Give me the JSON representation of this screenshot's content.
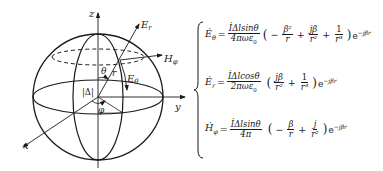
{
  "diagram": {
    "type": "spherical-coordinate dipole radiation field",
    "axes": {
      "z": "z",
      "y": "y",
      "x": "x"
    },
    "labels": {
      "E_r": "E",
      "E_r_sub": "r",
      "H_phi": "H",
      "H_phi_sub": "φ",
      "E_theta": "E",
      "E_theta_sub": "θ",
      "theta": "θ",
      "r": "r",
      "phi": "φ",
      "dipole": "|Δ|"
    }
  },
  "equations": [
    {
      "lhs": "Ė",
      "lhs_sub": "θ",
      "equals": "=",
      "coef_num": "İΔlsinθ",
      "coef_den": "4πωε",
      "coef_den_sub": "0",
      "terms": [
        {
          "sign": "−",
          "num": "β²",
          "den": "r"
        },
        {
          "sign": "+",
          "num": "jβ",
          "den": "r²"
        },
        {
          "sign": "+",
          "num": "1",
          "den": "r³"
        }
      ],
      "exp": "e",
      "exp_power": "−jβr"
    },
    {
      "lhs": "Ė",
      "lhs_sub": "r",
      "equals": "=",
      "coef_num": "İΔlcosθ",
      "coef_den": "2πωε",
      "coef_den_sub": "0",
      "terms": [
        {
          "sign": "",
          "num": "jβ",
          "den": "r²"
        },
        {
          "sign": "+",
          "num": "1",
          "den": "r³"
        }
      ],
      "exp": "e",
      "exp_power": "−jβr"
    },
    {
      "lhs": "Ḣ",
      "lhs_sub": "φ",
      "equals": "=",
      "coef_num": "İΔlsinθ",
      "coef_den": "4π",
      "coef_den_sub": "",
      "terms": [
        {
          "sign": "−",
          "num": "β",
          "den": "r"
        },
        {
          "sign": "+",
          "num": "j",
          "den": "r²"
        }
      ],
      "exp": "e",
      "exp_power": "−jβr"
    }
  ]
}
